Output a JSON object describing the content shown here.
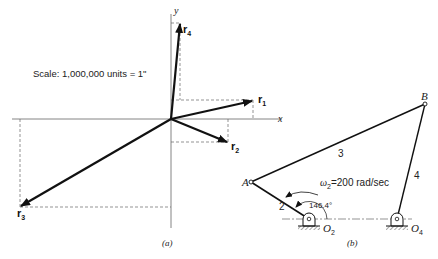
{
  "figure_a": {
    "caption": "(a)",
    "scale_text": "Scale: 1,000,000 units = 1\"",
    "axes": {
      "x_label": "x",
      "y_label": "y"
    },
    "vectors": [
      {
        "name": "r",
        "sub": "1"
      },
      {
        "name": "r",
        "sub": "2"
      },
      {
        "name": "r",
        "sub": "3"
      },
      {
        "name": "r",
        "sub": "4"
      }
    ]
  },
  "figure_b": {
    "caption": "(b)",
    "points": {
      "A": "A",
      "B": "B",
      "O2": "O",
      "O2_sub": "2",
      "O4": "O",
      "O4_sub": "4"
    },
    "links": [
      "2",
      "3",
      "4"
    ],
    "omega": {
      "symbol": "ω",
      "sub": "2",
      "value": "=200 rad/sec"
    },
    "angle": "146.4°"
  },
  "colors": {
    "ink": "#111111",
    "dash": "#555555"
  }
}
